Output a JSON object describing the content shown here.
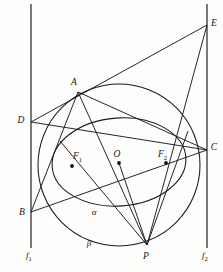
{
  "figure": {
    "background_color": "#fdfdfc",
    "stroke_color": "#1a1a1a",
    "axis_color": "#3a3a3a",
    "width": 223,
    "height": 272
  },
  "directrices": [
    {
      "name": "f1",
      "label": "f",
      "subscript": "1",
      "x": 31,
      "y_top": 4,
      "y_bottom": 248,
      "label_x": 27,
      "label_y": 256
    },
    {
      "name": "f2",
      "label": "f",
      "subscript": "2",
      "x": 207,
      "y_top": 4,
      "y_bottom": 248,
      "label_x": 203,
      "label_y": 256
    }
  ],
  "points": [
    {
      "id": "A",
      "label": "A",
      "sub": "",
      "x": 78,
      "y": 92,
      "label_x": 74,
      "label_y": 83,
      "dot": false
    },
    {
      "id": "B",
      "label": "B",
      "sub": "",
      "x": 31,
      "y": 212,
      "label_x": 22,
      "label_y": 213,
      "dot": false
    },
    {
      "id": "C",
      "label": "C",
      "sub": "",
      "x": 207,
      "y": 150,
      "label_x": 213,
      "label_y": 148,
      "dot": false
    },
    {
      "id": "D",
      "label": "D",
      "sub": "",
      "x": 31,
      "y": 122,
      "label_x": 21,
      "label_y": 121,
      "dot": false
    },
    {
      "id": "E",
      "label": "E",
      "sub": "",
      "x": 207,
      "y": 25,
      "label_x": 212,
      "label_y": 24,
      "dot": false
    },
    {
      "id": "P",
      "label": "P",
      "sub": "",
      "x": 147,
      "y": 245,
      "label_x": 144,
      "label_y": 257,
      "dot": false
    },
    {
      "id": "O",
      "label": "O",
      "sub": "",
      "x": 119,
      "y": 163,
      "label_x": 116,
      "label_y": 155,
      "dot": true
    },
    {
      "id": "F1",
      "label": "F",
      "sub": "1",
      "x": 72,
      "y": 166,
      "label_x": 76,
      "label_y": 157,
      "dot": true
    },
    {
      "id": "F2",
      "label": "F",
      "sub": "2",
      "x": 166,
      "y": 163,
      "label_x": 161,
      "label_y": 155,
      "dot": true
    }
  ],
  "conics": [
    {
      "id": "alpha",
      "type": "ellipse",
      "label": "α",
      "cx": 119,
      "cy": 162,
      "rx": 67,
      "ry": 44,
      "rotation": -4,
      "label_x": 94,
      "label_y": 213
    },
    {
      "id": "beta",
      "type": "circle",
      "label": "β",
      "cx": 119,
      "cy": 165,
      "r": 81,
      "label_x": 89,
      "label_y": 244
    }
  ],
  "segments": [
    {
      "id": "D-E",
      "from": "D",
      "to": "E"
    },
    {
      "id": "D-C",
      "from": "D",
      "to": "C"
    },
    {
      "id": "A-C",
      "from": "A",
      "to": "C"
    },
    {
      "id": "A-B",
      "from": "A",
      "to": "B"
    },
    {
      "id": "A-P",
      "from": "A",
      "to": "P"
    },
    {
      "id": "B-C",
      "from": "B",
      "to": "C"
    },
    {
      "id": "E-P",
      "from": "E",
      "to": "P"
    },
    {
      "id": "O-P",
      "from": "O",
      "to": "P"
    },
    {
      "id": "P-F1-ray",
      "from": "P",
      "to": "F1-ext"
    },
    {
      "id": "P-F2-ray",
      "from": "P",
      "to": "F2-ext"
    }
  ],
  "labels": {
    "alpha": "α",
    "beta": "β",
    "f1": "f",
    "f1_sub": "1",
    "f2": "f",
    "f2_sub": "2",
    "A": "A",
    "B": "B",
    "C": "C",
    "D": "D",
    "E": "E",
    "P": "P",
    "O": "O",
    "F": "F",
    "F1_sub": "1",
    "F2_sub": "2"
  }
}
